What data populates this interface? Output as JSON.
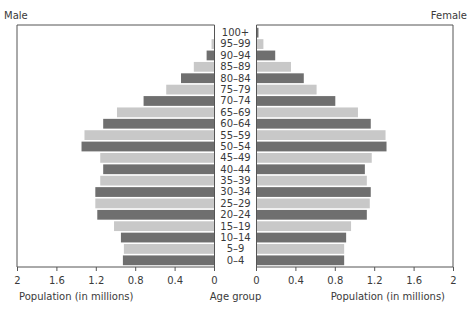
{
  "chart_data": {
    "type": "bar",
    "orientation": "horizontal",
    "subtype": "population-pyramid",
    "title": "",
    "categories": [
      "100+",
      "95–99",
      "90–94",
      "85–89",
      "80–84",
      "75–79",
      "70–74",
      "65–69",
      "60–64",
      "55–59",
      "50–54",
      "45–49",
      "40–44",
      "35–39",
      "30–34",
      "25–29",
      "20–24",
      "15–19",
      "10–14",
      "5–9",
      "0–4"
    ],
    "series": [
      {
        "name": "Male",
        "side": "left",
        "values": [
          0.0,
          0.03,
          0.08,
          0.21,
          0.34,
          0.49,
          0.72,
          0.99,
          1.13,
          1.32,
          1.35,
          1.16,
          1.13,
          1.16,
          1.21,
          1.21,
          1.19,
          1.02,
          0.95,
          0.92,
          0.93
        ]
      },
      {
        "name": "Female",
        "side": "right",
        "values": [
          0.02,
          0.07,
          0.19,
          0.35,
          0.48,
          0.61,
          0.8,
          1.03,
          1.16,
          1.31,
          1.32,
          1.17,
          1.1,
          1.12,
          1.16,
          1.15,
          1.12,
          0.96,
          0.91,
          0.89,
          0.89
        ]
      }
    ],
    "colors": {
      "dark": "#6f6f6f",
      "light": "#c8c8c8",
      "frame": "#555555"
    },
    "bar_shading": "alternating dark/light by row, starting dark at 0–4",
    "xlim": [
      0,
      2
    ],
    "left_ticks": [
      "2",
      "1.6",
      "1.2",
      "0.8",
      "0.4",
      "0"
    ],
    "right_ticks": [
      "0",
      "0.4",
      "0.8",
      "1.2",
      "1.6",
      "2"
    ],
    "left_xlabel": "Population (in millions)",
    "right_xlabel": "Population (in millions)",
    "center_label": "Age group",
    "left_title": "Male",
    "right_title": "Female",
    "grid": false,
    "legend": "none"
  }
}
